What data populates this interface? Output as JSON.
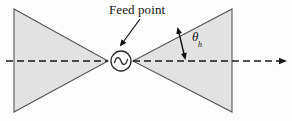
{
  "figure": {
    "background_color": "#fdfdfd",
    "width": 292,
    "height": 121
  },
  "labels": {
    "feed_point": "Feed point",
    "half_angle_symbol": "θ",
    "half_angle_subscript": "h"
  },
  "colors": {
    "triangle_fill": "#e2e2e2",
    "triangle_stroke": "#58585a",
    "axis_stroke": "#1a1a1a",
    "annotation_stroke": "#111111",
    "source_stroke": "#2a2a2a",
    "text": "#141414"
  },
  "geometry": {
    "axis_y": 61,
    "left_triangle": {
      "base_x": 14,
      "top_y": 9,
      "bottom_y": 112,
      "apex_x": 108
    },
    "right_triangle": {
      "apex_x": 133,
      "base_x": 232,
      "top_y": 9,
      "bottom_y": 112
    },
    "feed_source": {
      "cx": 121,
      "cy": 61,
      "r": 10
    },
    "axis_line": {
      "x_start": 6,
      "x_end": 284
    },
    "arrow_tip_x": 284,
    "leader_line": {
      "x1": 140,
      "y1": 19,
      "x2": 120,
      "y2": 44
    },
    "theta_arrow": {
      "x1": 179,
      "y1": 29,
      "x2": 186,
      "y2": 59
    }
  },
  "icons": {
    "ac_source": "sine-wave-icon",
    "axis_arrowhead": "arrow-right-icon",
    "leader_arrowhead": "arrow-down-left-icon",
    "angle_arrow": "double-arrow-icon"
  }
}
